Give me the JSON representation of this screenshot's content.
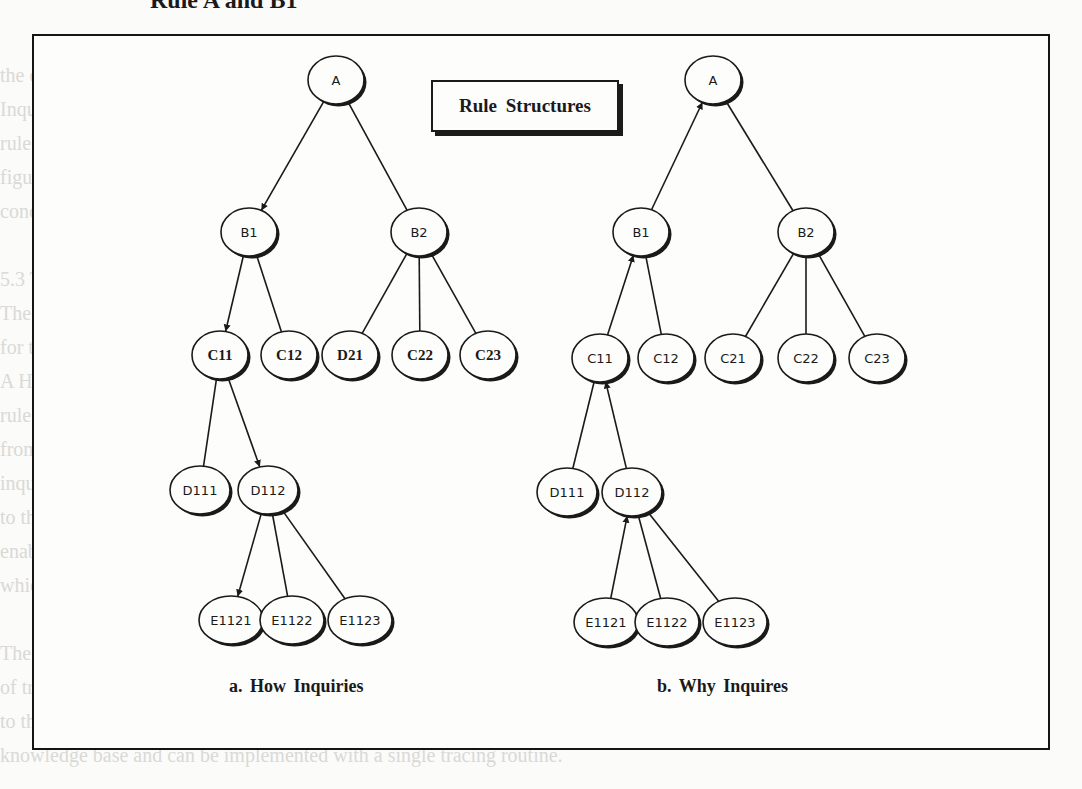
{
  "page": {
    "heading_fragment": "Rule A and B1",
    "background_lines": [
      "the decomposition of the rules which  will be examined in the following section.",
      "   Inquiries about a conclusion reached during  consultation are handled by tracing the",
      "   rule structures. This is demonstrated  for both How and Why inquiries, as in the",
      "   figure below. The rules  are traced by the inference engine to identify the",
      "   conclusions or goals that are relevant  to the question posed by the user.",
      "",
      "   5.3  Tracing  of  Inquiries  in  Rule  Structures",
      "   The system  traces the rule  structure  to determine  the  relevant  information",
      "   for the inquiry  posed  by the user.",
      "   A How inquiry  traces  down  the  rule  structure  from  the conclusion of the",
      "   rule  to the conditions  that  were  satisfied,  while  a Why inquiry  traces  up",
      "   from  the  condition  being  evaluated  to  the  goal  which  it  supports.  Each",
      "   inquiry  is  handled  by  following  the  arrows  shown,  from  the  initial  node",
      "   to  the  terminal  node.  Knowledge  of  the  rules  and  their  conditions",
      "   enables  the  system  to  explain  its  line  of  reasoning  to  the  user,",
      "   which  is  essential  for  expert  systems.",
      "",
      "   The  difference  between  How  and  Why  inquiries  lies  in  the  direction",
      "   of  tracing  through  the  rule  structures  and  the  nodes  that  are  reported",
      "   to  the  user.  Both  use  the  same  rule  structure  representation  in  the",
      "   knowledge  base  and  can  be  implemented  with  a  single  tracing  routine."
    ]
  },
  "figure": {
    "title": "Rule Structures",
    "trees": [
      {
        "id": "how",
        "caption": "a.  How Inquiries",
        "nodes": [
          {
            "id": "A",
            "label": "A",
            "x": 336,
            "y": 80,
            "style": "sans"
          },
          {
            "id": "B1",
            "label": "B1",
            "x": 249,
            "y": 232,
            "style": "sans"
          },
          {
            "id": "B2",
            "label": "B2",
            "x": 419,
            "y": 232,
            "style": "sans"
          },
          {
            "id": "C11",
            "label": "C11",
            "x": 220,
            "y": 355,
            "style": "serif"
          },
          {
            "id": "C12",
            "label": "C12",
            "x": 289,
            "y": 355,
            "style": "serif"
          },
          {
            "id": "D21",
            "label": "D21",
            "x": 350,
            "y": 355,
            "style": "serif"
          },
          {
            "id": "C22",
            "label": "C22",
            "x": 420,
            "y": 355,
            "style": "serif"
          },
          {
            "id": "C23",
            "label": "C23",
            "x": 488,
            "y": 355,
            "style": "serif"
          },
          {
            "id": "D111",
            "label": "D111",
            "x": 200,
            "y": 490,
            "style": "sans"
          },
          {
            "id": "D112",
            "label": "D112",
            "x": 268,
            "y": 490,
            "style": "sans"
          },
          {
            "id": "E1121",
            "label": "E1121",
            "x": 231,
            "y": 620,
            "style": "sans"
          },
          {
            "id": "E1122",
            "label": "E1122",
            "x": 292,
            "y": 620,
            "style": "sans"
          },
          {
            "id": "E1123",
            "label": "E1123",
            "x": 360,
            "y": 620,
            "style": "sans"
          }
        ],
        "edges": [
          {
            "from": "A",
            "to": "B1",
            "arrow": "to"
          },
          {
            "from": "A",
            "to": "B2",
            "arrow": "none"
          },
          {
            "from": "B1",
            "to": "C11",
            "arrow": "to"
          },
          {
            "from": "B1",
            "to": "C12",
            "arrow": "none"
          },
          {
            "from": "B2",
            "to": "D21",
            "arrow": "none"
          },
          {
            "from": "B2",
            "to": "C22",
            "arrow": "none"
          },
          {
            "from": "B2",
            "to": "C23",
            "arrow": "none"
          },
          {
            "from": "C11",
            "to": "D111",
            "arrow": "none"
          },
          {
            "from": "C11",
            "to": "D112",
            "arrow": "to"
          },
          {
            "from": "D112",
            "to": "E1121",
            "arrow": "to"
          },
          {
            "from": "D112",
            "to": "E1122",
            "arrow": "none"
          },
          {
            "from": "D112",
            "to": "E1123",
            "arrow": "none"
          }
        ]
      },
      {
        "id": "why",
        "caption": "b.  Why Inquires",
        "nodes": [
          {
            "id": "A",
            "label": "A",
            "x": 713,
            "y": 80,
            "style": "sans"
          },
          {
            "id": "B1",
            "label": "B1",
            "x": 641,
            "y": 232,
            "style": "sans"
          },
          {
            "id": "B2",
            "label": "B2",
            "x": 806,
            "y": 232,
            "style": "sans"
          },
          {
            "id": "C11",
            "label": "C11",
            "x": 600,
            "y": 358,
            "style": "sans"
          },
          {
            "id": "C12",
            "label": "C12",
            "x": 666,
            "y": 358,
            "style": "sans"
          },
          {
            "id": "C21",
            "label": "C21",
            "x": 733,
            "y": 358,
            "style": "sans"
          },
          {
            "id": "C22",
            "label": "C22",
            "x": 806,
            "y": 358,
            "style": "sans"
          },
          {
            "id": "C23",
            "label": "C23",
            "x": 877,
            "y": 358,
            "style": "sans"
          },
          {
            "id": "D111",
            "label": "D111",
            "x": 567,
            "y": 492,
            "style": "sans"
          },
          {
            "id": "D112",
            "label": "D112",
            "x": 632,
            "y": 492,
            "style": "sans"
          },
          {
            "id": "E1121",
            "label": "E1121",
            "x": 606,
            "y": 622,
            "style": "sans"
          },
          {
            "id": "E1122",
            "label": "E1122",
            "x": 667,
            "y": 622,
            "style": "sans"
          },
          {
            "id": "E1123",
            "label": "E1123",
            "x": 735,
            "y": 622,
            "style": "sans"
          }
        ],
        "edges": [
          {
            "from": "A",
            "to": "B1",
            "arrow": "from"
          },
          {
            "from": "A",
            "to": "B2",
            "arrow": "none"
          },
          {
            "from": "B1",
            "to": "C11",
            "arrow": "from"
          },
          {
            "from": "B1",
            "to": "C12",
            "arrow": "none"
          },
          {
            "from": "B2",
            "to": "C21",
            "arrow": "none"
          },
          {
            "from": "B2",
            "to": "C22",
            "arrow": "none"
          },
          {
            "from": "B2",
            "to": "C23",
            "arrow": "none"
          },
          {
            "from": "C11",
            "to": "D111",
            "arrow": "none"
          },
          {
            "from": "C11",
            "to": "D112",
            "arrow": "from"
          },
          {
            "from": "D112",
            "to": "E1121",
            "arrow": "from"
          },
          {
            "from": "D112",
            "to": "E1122",
            "arrow": "none"
          },
          {
            "from": "D112",
            "to": "E1123",
            "arrow": "none"
          }
        ]
      }
    ]
  },
  "style": {
    "ink": "#1a1a1a",
    "paper": "#fdfdfc",
    "node_rx": 28,
    "node_ry": 24
  }
}
